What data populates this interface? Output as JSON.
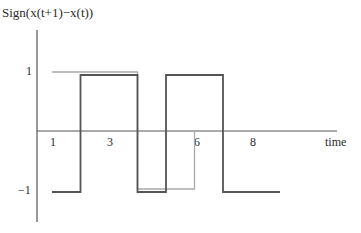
{
  "chart_data": {
    "type": "line",
    "step": true,
    "title": "",
    "ylabel": "Sign(x(t+1)−x(t))",
    "xlabel": "time",
    "x_ticks": [
      "1",
      "3",
      "6",
      "8"
    ],
    "y_ticks": [
      "1",
      "−1"
    ],
    "ylim": [
      -1,
      1
    ],
    "xlim": [
      1,
      9
    ],
    "grid": false,
    "legend": null,
    "series": [
      {
        "name": "dark",
        "color": "#555555",
        "points": [
          [
            1,
            -1
          ],
          [
            2,
            -1
          ],
          [
            2,
            1
          ],
          [
            4,
            1
          ],
          [
            4,
            -1
          ],
          [
            5,
            -1
          ],
          [
            5,
            1
          ],
          [
            7,
            1
          ],
          [
            7,
            -1
          ],
          [
            9,
            -1
          ]
        ]
      },
      {
        "name": "light",
        "color": "#aaaaaa",
        "points": [
          [
            1,
            1
          ],
          [
            4,
            1
          ],
          [
            4,
            -1
          ],
          [
            6,
            -1
          ],
          [
            6,
            0
          ]
        ]
      }
    ]
  }
}
